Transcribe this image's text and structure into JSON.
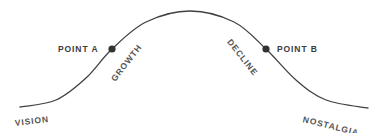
{
  "chart_data": {
    "type": "line",
    "title": "",
    "xlabel": "",
    "ylabel": "",
    "grid": false,
    "legend_position": "none",
    "xlim": [
      0,
      377
    ],
    "ylim": [
      133,
      0
    ],
    "series": [
      {
        "name": "curve",
        "color": "#404040",
        "stroke_width": 1.3,
        "path_points": [
          {
            "x": 20,
            "y": 107
          },
          {
            "x": 56,
            "y": 100
          },
          {
            "x": 86,
            "y": 78
          },
          {
            "x": 112,
            "y": 49
          },
          {
            "x": 146,
            "y": 22
          },
          {
            "x": 190,
            "y": 11
          },
          {
            "x": 234,
            "y": 22
          },
          {
            "x": 266,
            "y": 49
          },
          {
            "x": 296,
            "y": 80
          },
          {
            "x": 326,
            "y": 100
          },
          {
            "x": 368,
            "y": 108
          }
        ]
      }
    ],
    "markers": [
      {
        "name": "point-a",
        "x": 112,
        "y": 49,
        "radius": 3.6,
        "color": "#333333",
        "label": "POINT A"
      },
      {
        "name": "point-b",
        "x": 266,
        "y": 49,
        "radius": 3.6,
        "color": "#333333",
        "label": "POINT B"
      }
    ],
    "annotations": [
      {
        "name": "point-a",
        "text": "POINT A",
        "rotation_deg": 0
      },
      {
        "name": "growth",
        "text": "GROWTH",
        "rotation_deg": -52
      },
      {
        "name": "decline",
        "text": "DECLINE",
        "rotation_deg": 52
      },
      {
        "name": "point-b",
        "text": "POINT B",
        "rotation_deg": 0
      },
      {
        "name": "vision",
        "text": "VISION",
        "rotation_deg": -7
      },
      {
        "name": "nostalgia",
        "text": "NOSTALGIA",
        "rotation_deg": 14
      }
    ]
  },
  "labels": {
    "point_a": "POINT A",
    "point_b": "POINT B",
    "growth": "GROWTH",
    "decline": "DECLINE",
    "vision": "VISION",
    "nostalgia": "NOSTALGIA"
  },
  "colors": {
    "background": "#ffffff",
    "curve": "#404040",
    "marker": "#333333",
    "text": "#3c3c3c"
  }
}
